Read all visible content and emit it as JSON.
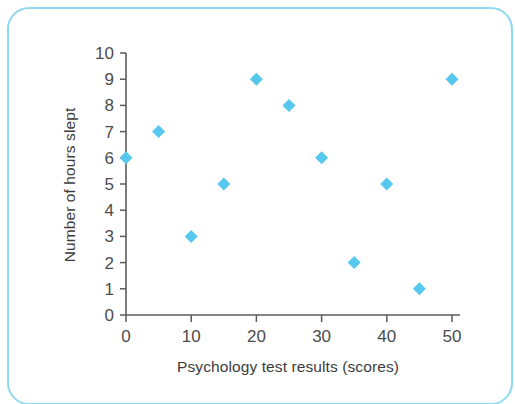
{
  "figure": {
    "frame_color": "#8fd9f2",
    "background": "#ffffff"
  },
  "chart_data": {
    "type": "scatter",
    "title": "",
    "xlabel": "Psychology test results (scores)",
    "ylabel": "Number of hours slept",
    "xlim": [
      0,
      50
    ],
    "ylim": [
      0,
      10
    ],
    "xticks": [
      "0",
      "10",
      "20",
      "30",
      "40",
      "50"
    ],
    "xtick_values": [
      0,
      10,
      20,
      30,
      40,
      50
    ],
    "yticks": [
      "0",
      "1",
      "2",
      "3",
      "4",
      "5",
      "6",
      "7",
      "8",
      "9",
      "10"
    ],
    "ytick_values": [
      0,
      1,
      2,
      3,
      4,
      5,
      6,
      7,
      8,
      9,
      10
    ],
    "grid": false,
    "legend": null,
    "marker": {
      "shape": "diamond",
      "color": "#56c8ee",
      "size": 13
    },
    "points": [
      {
        "x": 0,
        "y": 6
      },
      {
        "x": 5,
        "y": 7
      },
      {
        "x": 10,
        "y": 3
      },
      {
        "x": 15,
        "y": 5
      },
      {
        "x": 20,
        "y": 9
      },
      {
        "x": 25,
        "y": 8
      },
      {
        "x": 30,
        "y": 6
      },
      {
        "x": 35,
        "y": 2
      },
      {
        "x": 40,
        "y": 5
      },
      {
        "x": 45,
        "y": 1
      },
      {
        "x": 50,
        "y": 9
      }
    ]
  }
}
